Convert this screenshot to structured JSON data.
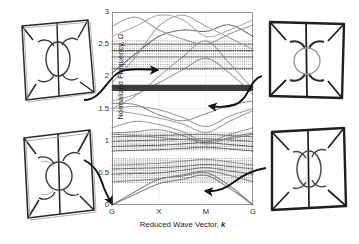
{
  "figure": {
    "background_color": "#ffffff",
    "axis_color": "#3a3a3a"
  },
  "chart_data": {
    "type": "line",
    "title": "",
    "subtitle": "",
    "xlabel_prefix": "Reduced Wave Vector, ",
    "xlabel_symbol": "k",
    "ylabel": "Normalized Frequency, Ω",
    "grid": false,
    "legend": "none",
    "xlim": [
      0,
      3
    ],
    "ylim": [
      0,
      3
    ],
    "yticks": [
      0,
      0.5,
      1,
      1.5,
      2,
      2.5,
      3
    ],
    "ytick_labels": [
      "0",
      "0.5",
      "1",
      "1.5",
      "2",
      "2.5",
      "3"
    ],
    "xticks": [
      0,
      1,
      2,
      3
    ],
    "xtick_labels": [
      "G",
      "X",
      "M",
      "G"
    ],
    "xtick_note": "high-symmetry path G-X-M-G of the irreducible Brillouin zone",
    "line_style": "dotted",
    "series": [
      {
        "name": "band-01",
        "color": "#6d6d6d",
        "x": [
          0,
          0.5,
          1,
          1.5,
          2,
          2.5,
          3
        ],
        "values": [
          0.0,
          0.17,
          0.33,
          0.4,
          0.46,
          0.26,
          0.0
        ]
      },
      {
        "name": "band-02",
        "color": "#6d6d6d",
        "x": [
          0,
          0.5,
          1,
          1.5,
          2,
          2.5,
          3
        ],
        "values": [
          0.0,
          0.21,
          0.4,
          0.45,
          0.5,
          0.3,
          0.0
        ]
      },
      {
        "name": "band-03",
        "color": "#777777",
        "x": [
          0,
          0.5,
          1,
          1.5,
          2,
          2.5,
          3
        ],
        "values": [
          0.36,
          0.38,
          0.41,
          0.47,
          0.53,
          0.46,
          0.36
        ]
      },
      {
        "name": "band-04",
        "color": "#555555",
        "x": [
          0,
          0.5,
          1,
          1.5,
          2,
          2.5,
          3
        ],
        "values": [
          0.48,
          0.49,
          0.5,
          0.54,
          0.58,
          0.53,
          0.48
        ]
      },
      {
        "name": "band-05",
        "color": "#5d5d5d",
        "x": [
          0,
          0.5,
          1,
          1.5,
          2,
          2.5,
          3
        ],
        "values": [
          0.56,
          0.57,
          0.58,
          0.6,
          0.63,
          0.6,
          0.56
        ]
      },
      {
        "name": "band-06",
        "color": "#8a8a8a",
        "x": [
          0,
          0.5,
          1,
          1.5,
          2,
          2.5,
          3
        ],
        "values": [
          0.62,
          0.63,
          0.65,
          0.68,
          0.71,
          0.67,
          0.62
        ]
      },
      {
        "name": "band-07",
        "color": "#4f4f4f",
        "x": [
          0,
          0.5,
          1,
          1.5,
          2,
          2.5,
          3
        ],
        "values": [
          0.84,
          0.85,
          0.86,
          0.88,
          0.9,
          0.87,
          0.84
        ]
      },
      {
        "name": "band-08",
        "color": "#444444",
        "x": [
          0,
          0.5,
          1,
          1.5,
          2,
          2.5,
          3
        ],
        "values": [
          0.91,
          0.92,
          0.93,
          0.95,
          0.97,
          0.94,
          0.91
        ]
      },
      {
        "name": "band-09",
        "color": "#595959",
        "x": [
          0,
          0.5,
          1,
          1.5,
          2,
          2.5,
          3
        ],
        "values": [
          0.99,
          1.0,
          1.01,
          1.02,
          1.03,
          1.01,
          0.99
        ]
      },
      {
        "name": "band-10",
        "color": "#6b6b6b",
        "x": [
          0,
          0.5,
          1,
          1.5,
          2,
          2.5,
          3
        ],
        "values": [
          1.06,
          1.07,
          1.08,
          1.09,
          1.1,
          1.08,
          1.06
        ]
      },
      {
        "name": "band-11",
        "color": "#7a7a7a",
        "x": [
          0,
          0.5,
          1,
          1.5,
          2,
          2.5,
          3
        ],
        "values": [
          1.1,
          1.08,
          1.05,
          1.02,
          1.0,
          1.03,
          1.1
        ]
      },
      {
        "name": "band-12",
        "color": "#808080",
        "x": [
          0,
          0.5,
          1,
          1.5,
          2,
          2.5,
          3
        ],
        "values": [
          1.12,
          1.14,
          1.17,
          1.08,
          0.95,
          1.05,
          1.12
        ]
      },
      {
        "name": "band-13",
        "color": "#8c8c8c",
        "x": [
          0,
          0.5,
          1,
          1.5,
          2,
          2.5,
          3
        ],
        "values": [
          1.2,
          1.3,
          1.25,
          1.14,
          0.98,
          1.1,
          1.2
        ]
      },
      {
        "name": "band-14",
        "color": "#949494",
        "x": [
          0,
          0.5,
          1,
          1.5,
          2,
          2.5,
          3
        ],
        "values": [
          1.47,
          1.42,
          1.35,
          1.26,
          1.13,
          1.3,
          1.47
        ]
      },
      {
        "name": "band-15",
        "color": "#8f8f8f",
        "x": [
          0,
          0.5,
          1,
          1.5,
          2,
          2.5,
          3
        ],
        "values": [
          1.5,
          1.53,
          1.48,
          1.36,
          1.22,
          1.38,
          1.5
        ]
      },
      {
        "name": "band-16",
        "color": "#7d7d7d",
        "x": [
          0,
          0.5,
          1,
          1.5,
          2,
          2.5,
          3
        ],
        "values": [
          1.58,
          1.56,
          1.4,
          1.31,
          1.42,
          1.55,
          1.62
        ]
      },
      {
        "name": "band-17",
        "color": "#3f3f3f",
        "x": [
          0,
          0.5,
          1,
          1.5,
          2,
          2.5,
          3
        ],
        "values": [
          1.8,
          1.8,
          1.8,
          1.8,
          1.8,
          1.8,
          1.8
        ]
      },
      {
        "name": "band-18",
        "color": "#474747",
        "x": [
          0,
          0.5,
          1,
          1.5,
          2,
          2.5,
          3
        ],
        "values": [
          1.84,
          1.84,
          1.84,
          1.84,
          1.84,
          1.84,
          1.84
        ]
      },
      {
        "name": "band-19",
        "color": "#8d8d8d",
        "x": [
          0,
          0.5,
          1,
          1.5,
          2,
          2.5,
          3
        ],
        "values": [
          1.62,
          1.72,
          1.9,
          2.1,
          2.28,
          2.05,
          1.72
        ]
      },
      {
        "name": "band-20",
        "color": "#9a9a9a",
        "x": [
          0,
          0.5,
          1,
          1.5,
          2,
          2.5,
          3
        ],
        "values": [
          1.5,
          1.7,
          2.0,
          2.3,
          2.55,
          2.2,
          1.8
        ]
      },
      {
        "name": "band-21",
        "color": "#6a6a6a",
        "x": [
          0,
          0.5,
          1,
          1.5,
          2,
          2.5,
          3
        ],
        "values": [
          2.12,
          2.12,
          2.12,
          2.12,
          2.12,
          2.12,
          2.12
        ]
      },
      {
        "name": "band-22",
        "color": "#585858",
        "x": [
          0,
          0.5,
          1,
          1.5,
          2,
          2.5,
          3
        ],
        "values": [
          2.3,
          2.3,
          2.3,
          2.3,
          2.3,
          2.3,
          2.3
        ]
      },
      {
        "name": "band-23",
        "color": "#4a4a4a",
        "x": [
          0,
          0.5,
          1,
          1.5,
          2,
          2.5,
          3
        ],
        "values": [
          2.4,
          2.4,
          2.4,
          2.4,
          2.4,
          2.4,
          2.4
        ]
      },
      {
        "name": "band-24",
        "color": "#707070",
        "x": [
          0,
          0.5,
          1,
          1.5,
          2,
          2.5,
          3
        ],
        "values": [
          2.5,
          2.5,
          2.5,
          2.5,
          2.5,
          2.5,
          2.5
        ]
      },
      {
        "name": "band-25",
        "color": "#555555",
        "x": [
          0,
          0.5,
          1,
          1.5,
          2,
          2.5,
          3
        ],
        "values": [
          2.05,
          2.35,
          2.62,
          2.72,
          2.7,
          2.8,
          2.62
        ]
      },
      {
        "name": "band-26",
        "color": "#9c9c9c",
        "x": [
          0,
          0.5,
          1,
          1.5,
          2,
          2.5,
          3
        ],
        "values": [
          1.9,
          2.3,
          2.78,
          2.95,
          2.78,
          2.6,
          2.42
        ]
      },
      {
        "name": "band-27",
        "color": "#a2a2a2",
        "x": [
          0,
          0.5,
          1,
          1.5,
          2,
          2.5,
          3
        ],
        "values": [
          2.62,
          2.78,
          2.95,
          2.88,
          2.62,
          2.72,
          2.88
        ]
      },
      {
        "name": "band-28",
        "color": "#8b8b8b",
        "x": [
          0,
          0.5,
          1,
          1.5,
          2,
          2.5,
          3
        ],
        "values": [
          2.78,
          2.92,
          2.72,
          2.58,
          2.5,
          2.66,
          2.8
        ]
      }
    ],
    "flat_band_clusters": [
      {
        "name": "cluster-low",
        "range": [
          0.33,
          0.72
        ],
        "density": "high"
      },
      {
        "name": "cluster-mid",
        "range": [
          0.84,
          1.12
        ],
        "density": "high"
      },
      {
        "name": "cluster-gap-band",
        "range": [
          1.78,
          1.86
        ],
        "density": "solid-dark"
      },
      {
        "name": "cluster-upper",
        "range": [
          2.1,
          2.55
        ],
        "density": "medium"
      }
    ]
  },
  "insets": [
    {
      "id": "inset-top-left",
      "name": "unit-cell-mode-top-left",
      "description": "deformed square unit cell with central ellipse and four petal voids",
      "mode": "mode-A",
      "stroke_color": "#2a2a2a"
    },
    {
      "id": "inset-bottom-left",
      "name": "unit-cell-mode-bottom-left",
      "description": "deformed square unit cell, rotated petal pattern with central ring",
      "mode": "mode-B",
      "stroke_color": "#2a2a2a"
    },
    {
      "id": "inset-top-right",
      "name": "unit-cell-mode-top-right",
      "description": "square unit cell, thick outline, central circle with four petals",
      "mode": "mode-C",
      "stroke_color": "#1f1f1f"
    },
    {
      "id": "inset-bottom-right",
      "name": "unit-cell-mode-bottom-right",
      "description": "square unit cell, vertical central ellipse with four crescent petals",
      "mode": "mode-D",
      "stroke_color": "#1f1f1f"
    }
  ],
  "annotations": [
    {
      "id": "arrow-top-left",
      "name": "leader-arrow-top-left",
      "from_inset": "inset-top-left",
      "points_to_frequency": 2.0,
      "points_to_wavevector": "between G and X"
    },
    {
      "id": "arrow-top-right",
      "name": "leader-arrow-top-right",
      "from_inset": "inset-top-right",
      "points_to_frequency": 1.55,
      "points_to_wavevector": "near M"
    },
    {
      "id": "arrow-bottom-left",
      "name": "leader-arrow-bottom-left",
      "from_inset": "inset-bottom-left",
      "points_to_frequency": 0.0,
      "points_to_wavevector": "G origin"
    },
    {
      "id": "arrow-bottom-right",
      "name": "leader-arrow-bottom-right",
      "from_inset": "inset-bottom-right",
      "points_to_frequency": 0.25,
      "points_to_wavevector": "between M and G"
    }
  ]
}
